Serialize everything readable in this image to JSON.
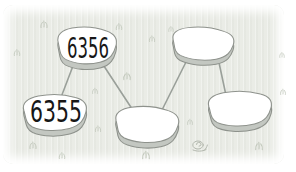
{
  "illustration": {
    "stones": [
      {
        "label": "6356",
        "state": "filled",
        "position": "top-left"
      },
      {
        "label": "6355",
        "state": "filled",
        "position": "bottom-left"
      },
      {
        "label": "",
        "state": "blank",
        "position": "bottom-middle"
      },
      {
        "label": "",
        "state": "blank",
        "position": "top-right"
      },
      {
        "label": "",
        "state": "blank",
        "position": "bottom-right"
      }
    ],
    "connections": [
      {
        "from": "stone-6355",
        "to": "stone-6356"
      },
      {
        "from": "stone-6356",
        "to": "stone-blank-bottom-middle"
      },
      {
        "from": "stone-blank-bottom-middle",
        "to": "stone-blank-top-right"
      },
      {
        "from": "stone-blank-top-right",
        "to": "stone-blank-bottom-right"
      }
    ],
    "decorations": {
      "grass_tuft_count": 14,
      "snail": "snail-doodle-icon"
    },
    "colors": {
      "meadow_background": "#eaece6",
      "stone_top": "#ffffff",
      "stone_side": "#c3c7c1",
      "stone_outline": "#8e928c",
      "connector_line": "#9aa09a",
      "number_text": "#171717",
      "grass": "#c2c8bc"
    }
  }
}
